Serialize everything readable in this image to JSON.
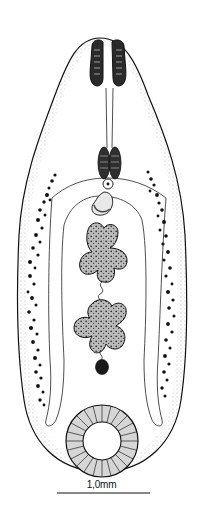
{
  "figure": {
    "background": "#ffffff",
    "ink": "#111111",
    "stipple": "#9a9a9a"
  },
  "scale_bar": {
    "label": "1,0mm",
    "x1": 57,
    "x2": 150,
    "y": 493
  },
  "structures": {
    "oral_sucker": {
      "cx": 107,
      "cy": 63,
      "w": 36,
      "h": 48
    },
    "esophagus": {
      "x1": 107,
      "x2": 112,
      "y1": 88,
      "y2": 150
    },
    "pharynx": {
      "cx": 109,
      "cy": 164,
      "rx": 11,
      "ry": 18
    },
    "genital_pore": {
      "cx": 108,
      "cy": 184,
      "r": 5
    },
    "cirrus_sac": {
      "cx": 101,
      "cy": 205
    },
    "anterior_testis": {
      "cx": 102,
      "cy": 262
    },
    "posterior_testis": {
      "cx": 100,
      "cy": 335
    },
    "ovary": {
      "cx": 102,
      "cy": 367,
      "r": 7
    },
    "ventral_sucker": {
      "cx": 102,
      "cy": 441,
      "r_outer": 36,
      "r_inner": 19
    }
  }
}
